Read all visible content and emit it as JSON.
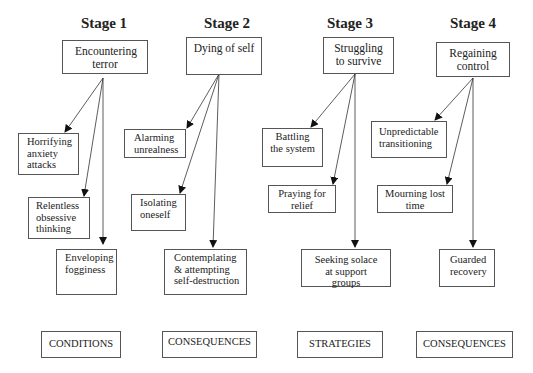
{
  "diagram": {
    "stages": [
      {
        "title": "Stage 1",
        "main": "Encountering terror",
        "children": [
          "Horrifying anxiety attacks",
          "Relentless obsessive thinking",
          "Enveloping fogginess"
        ],
        "category": "CONDITIONS"
      },
      {
        "title": "Stage 2",
        "main": "Dying of self",
        "children": [
          "Alarming unrealness",
          "Isolating oneself",
          "Contemplating & attempting self-destruction"
        ],
        "category": "CONSEQUENCES"
      },
      {
        "title": "Stage 3",
        "main": "Struggling to survive",
        "children": [
          "Battling the system",
          "Praying for relief",
          "Seeking solace at support groups"
        ],
        "category": "STRATEGIES"
      },
      {
        "title": "Stage 4",
        "main": "Regaining control",
        "children": [
          "Unpredictable transitioning",
          "Mourning lost time",
          "Guarded recovery"
        ],
        "category": "CONSEQUENCES"
      }
    ]
  }
}
